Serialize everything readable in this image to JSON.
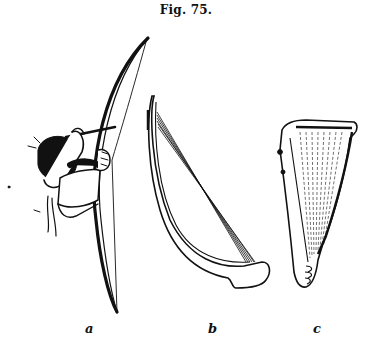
{
  "figure": {
    "caption": "Fig. 75.",
    "panels": [
      {
        "label": "a",
        "subject": "archer drawing a bow"
      },
      {
        "label": "b",
        "subject": "arched harp"
      },
      {
        "label": "c",
        "subject": "triangular harp"
      }
    ]
  }
}
